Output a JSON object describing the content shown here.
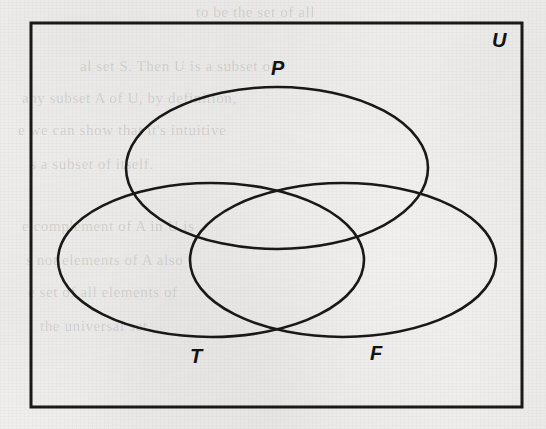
{
  "figure": {
    "type": "venn-diagram",
    "sets_count": 3,
    "universe_label": "U",
    "labels": {
      "universe": "U",
      "top_set": "P",
      "left_set": "T",
      "right_set": "F"
    },
    "colors": {
      "ink": "#141312",
      "paper": "#f2f1ef",
      "stroke": "#1a1918"
    }
  },
  "diagram": {
    "rectangle": {
      "name": "universal-set-rectangle",
      "x": 31,
      "y": 23,
      "width": 491,
      "height": 384,
      "stroke_width": 3
    },
    "ellipses": [
      {
        "name": "set-P",
        "label": "P",
        "cx": 277,
        "cy": 168,
        "rx": 151,
        "ry": 81,
        "stroke_width": 2.6
      },
      {
        "name": "set-T",
        "label": "T",
        "cx": 211,
        "cy": 260,
        "rx": 153,
        "ry": 77,
        "stroke_width": 2.6
      },
      {
        "name": "set-F",
        "label": "F",
        "cx": 343,
        "cy": 260,
        "rx": 153,
        "ry": 77,
        "stroke_width": 2.6
      }
    ],
    "label_positions": [
      {
        "name": "label-U",
        "text": "U",
        "x": 492,
        "y": 30
      },
      {
        "name": "label-P",
        "text": "P",
        "x": 271,
        "y": 58
      },
      {
        "name": "label-T",
        "text": "T",
        "x": 190,
        "y": 346
      },
      {
        "name": "label-F",
        "text": "F",
        "x": 370,
        "y": 343
      }
    ]
  },
  "background_text": {
    "note": "faint show-through text from the reverse side of the scanned page",
    "lines": [
      {
        "text": "to be the set of all",
        "x": 196,
        "y": 4
      },
      {
        "text": "al set  S. Then U is  a subset of",
        "x": 80,
        "y": 58
      },
      {
        "text": "any subset A of U, by definition,",
        "x": 22,
        "y": 90
      },
      {
        "text": "e we can show that it's  intuitive",
        "x": 18,
        "y": 122
      },
      {
        "text": "s  a  subset of  itself.",
        "x": 30,
        "y": 156
      },
      {
        "text": "e complement of A  in  U  is",
        "x": 22,
        "y": 218
      },
      {
        "text": "s  not  elements of  A  also",
        "x": 26,
        "y": 252
      },
      {
        "text": "e set  of  all  elements  of",
        "x": 28,
        "y": 284
      },
      {
        "text": "the  universal  set.",
        "x": 40,
        "y": 318
      }
    ]
  }
}
